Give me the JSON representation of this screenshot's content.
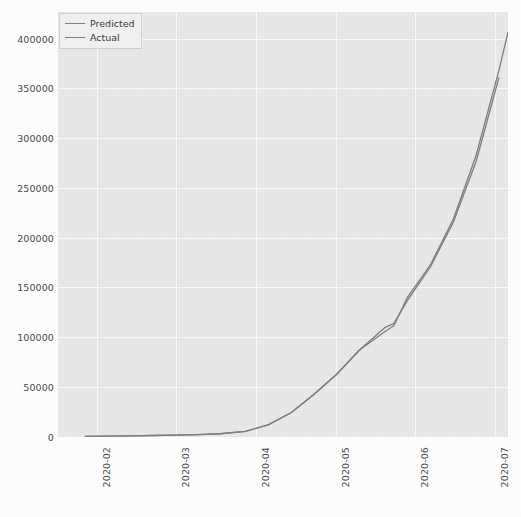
{
  "chart_data": {
    "type": "line",
    "title": "",
    "xlabel": "",
    "ylabel": "",
    "grid": true,
    "legend_position": "upper left",
    "xlim": [
      "2020-01-10",
      "2020-07-25"
    ],
    "ylim": [
      0,
      420000
    ],
    "yticks": [
      0,
      50000,
      100000,
      150000,
      200000,
      250000,
      300000,
      350000,
      400000
    ],
    "ytick_labels": [
      "0",
      "50000",
      "100000",
      "150000",
      "200000",
      "250000",
      "300000",
      "350000",
      "400000"
    ],
    "xticks": [
      "2020-02",
      "2020-03",
      "2020-04",
      "2020-05",
      "2020-06",
      "2020-07"
    ],
    "xtick_labels": [
      "2020-02",
      "2020-03",
      "2020-04",
      "2020-05",
      "2020-06",
      "2020-07"
    ],
    "xtick_rotation": 90,
    "series": [
      {
        "name": "Predicted",
        "color": "#7f7f7f",
        "x": [
          "2020-01-22",
          "2020-02-01",
          "2020-02-11",
          "2020-02-21",
          "2020-03-01",
          "2020-03-11",
          "2020-03-21",
          "2020-04-01",
          "2020-04-11",
          "2020-04-21",
          "2020-05-01",
          "2020-05-11",
          "2020-05-21",
          "2020-06-01",
          "2020-06-05",
          "2020-06-11",
          "2020-06-21",
          "2020-07-01",
          "2020-07-11",
          "2020-07-21"
        ],
        "values": [
          600,
          900,
          1200,
          1500,
          1900,
          2400,
          3200,
          5500,
          12000,
          24000,
          42000,
          62000,
          86000,
          108000,
          112000,
          135000,
          168000,
          212000,
          272000,
          355000
        ]
      },
      {
        "name": "Actual",
        "color": "#7f7f7f",
        "x": [
          "2020-01-22",
          "2020-02-01",
          "2020-02-11",
          "2020-02-21",
          "2020-03-01",
          "2020-03-11",
          "2020-03-21",
          "2020-04-01",
          "2020-04-11",
          "2020-04-21",
          "2020-05-01",
          "2020-05-11",
          "2020-05-21",
          "2020-06-01",
          "2020-06-05",
          "2020-06-11",
          "2020-06-21",
          "2020-07-01",
          "2020-07-11",
          "2020-07-21",
          "2020-07-25"
        ],
        "values": [
          600,
          900,
          1200,
          1500,
          1900,
          2400,
          3200,
          5500,
          12000,
          24000,
          42000,
          62000,
          86000,
          104000,
          110000,
          138000,
          170000,
          215000,
          278000,
          362000,
          400000
        ]
      }
    ],
    "annotations": []
  },
  "legend": {
    "items": [
      {
        "label": "Predicted"
      },
      {
        "label": "Actual"
      }
    ]
  }
}
